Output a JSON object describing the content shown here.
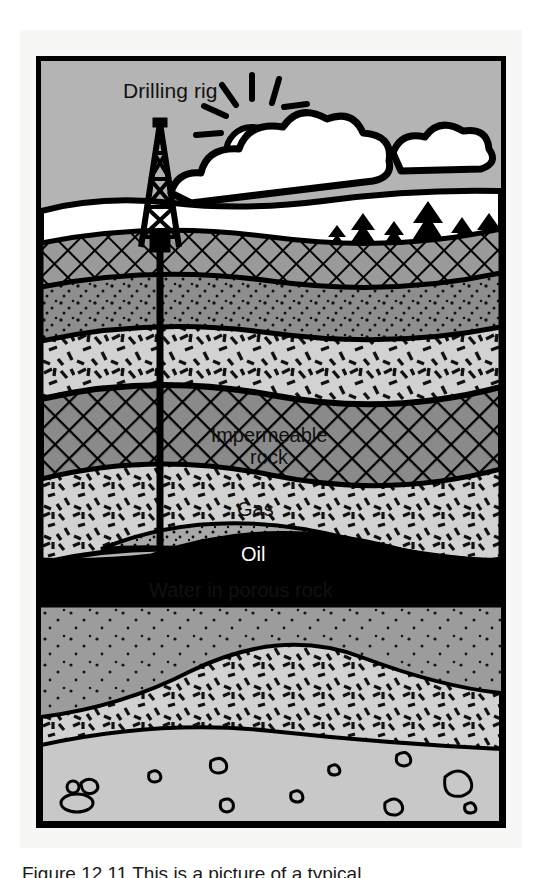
{
  "figure": {
    "frame_background": "#b4b4b4",
    "mount_background": "#f7f7f5",
    "border_color": "#000000"
  },
  "labels": {
    "drilling_rig": "Drilling rig",
    "impermeable_rock_line1": "Impermeable",
    "impermeable_rock_line2": "rock",
    "gas": "Gas",
    "oil": "Oil",
    "water": "Water in porous rock"
  },
  "caption": {
    "text": "Figure 12.11 This is a picture of a typical"
  },
  "scene": {
    "sky_color": "#b4b4b4",
    "cloud_color": "#ffffff",
    "tree_color": "#000000",
    "sun": "sun-with-rays"
  },
  "strata": [
    {
      "name": "topsoil-crosshatch",
      "pattern": "crosshatch",
      "fill": "#9a9a9a"
    },
    {
      "name": "stippled-dark-band",
      "pattern": "stipple",
      "fill": "#8e8e8e"
    },
    {
      "name": "upper-dash-rock",
      "pattern": "dashes",
      "fill": "#d2d2d2"
    },
    {
      "name": "impermeable-crosshatch",
      "pattern": "crosshatch",
      "fill": "#8a8a8a"
    },
    {
      "name": "reservoir-dash-rock",
      "pattern": "dashes",
      "fill": "#d2d2d2"
    },
    {
      "name": "gas-cap",
      "pattern": "stipple",
      "fill": "#a8a8a8"
    },
    {
      "name": "oil-band",
      "pattern": "solid",
      "fill": "#000000"
    },
    {
      "name": "water-porous-rock",
      "pattern": "stipple",
      "fill": "#9c9c9c"
    },
    {
      "name": "lower-dash-rock",
      "pattern": "dashes",
      "fill": "#d2d2d2"
    },
    {
      "name": "basement-with-clasts",
      "pattern": "clasts",
      "fill": "#c8c8c8"
    }
  ],
  "equipment": {
    "derrick": "drilling-derrick",
    "drill_pipe": "vertical-drill-pipe"
  }
}
